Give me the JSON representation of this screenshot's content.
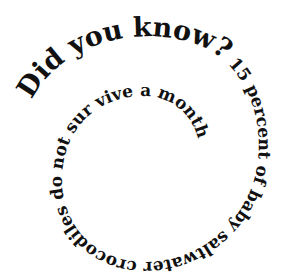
{
  "graphic": {
    "title_phrase": "Did you know?",
    "body_phrase": " 15 percent of baby saltwater crocodiles do not sur vive a month",
    "full_text": "Did you know? 15 percent of baby saltwater crocodiles do not sur vive a month",
    "text_color": "#111111",
    "background_color": "#ffffff",
    "layout": "spiral-clockwise-inward"
  }
}
